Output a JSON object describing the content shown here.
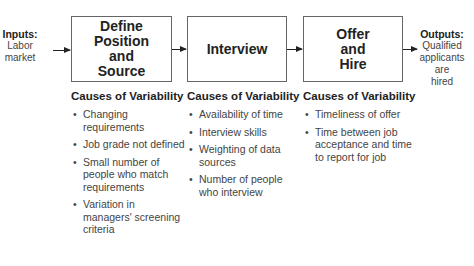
{
  "inputs": {
    "heading": "Inputs:",
    "line1": "Labor",
    "line2": "market"
  },
  "outputs": {
    "heading": "Outputs:",
    "line1": "Qualified",
    "line2": "applicants",
    "line3": "are",
    "line4": "hired"
  },
  "steps": [
    {
      "title_lines": [
        "Define Position",
        "and",
        "Source"
      ],
      "causes_title": "Causes of Variability",
      "causes": [
        "Changing requirements",
        "Job grade not defined",
        "Small number of people who match requirements",
        "Variation in managers' screening criteria"
      ]
    },
    {
      "title_lines": [
        "Interview"
      ],
      "causes_title": "Causes of Variability",
      "causes": [
        "Availability of time",
        "Interview skills",
        "Weighting of data sources",
        "Number of people who interview"
      ]
    },
    {
      "title_lines": [
        "Offer",
        "and",
        "Hire"
      ],
      "causes_title": "Causes of Variability",
      "causes": [
        "Timeliness of offer",
        "Time between job acceptance and time to report for job"
      ]
    }
  ],
  "bullet": "•"
}
